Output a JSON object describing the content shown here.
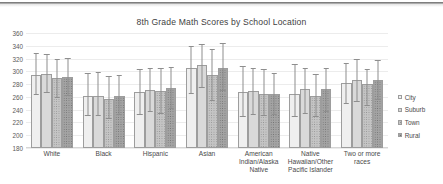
{
  "chart_data": {
    "type": "bar",
    "title": "8th Grade Math Scores by School Location",
    "xlabel": "",
    "ylabel": "",
    "ylim": [
      180,
      360
    ],
    "ytick_step": 20,
    "yticks": [
      360,
      340,
      320,
      300,
      280,
      260,
      240,
      220,
      200,
      180
    ],
    "grid": true,
    "legend_position": "right",
    "error_bars": true,
    "categories": [
      "White",
      "Black",
      "Hispanic",
      "Asian",
      "American Indian/Alaska Native",
      "Native Hawaiian/Other Pacific Islander",
      "Two or more races"
    ],
    "series": [
      {
        "name": "City",
        "color": "#efefef",
        "values": [
          295,
          261,
          267,
          305,
          267,
          265,
          281
        ],
        "err_low": [
          263,
          230,
          232,
          265,
          229,
          229,
          249
        ],
        "err_high": [
          329,
          297,
          303,
          340,
          308,
          311,
          313
        ]
      },
      {
        "name": "Suburb",
        "color": "#d9d9d9",
        "values": [
          296,
          262,
          271,
          310,
          269,
          272,
          287
        ],
        "err_low": [
          266,
          230,
          236,
          274,
          232,
          234,
          252
        ],
        "err_high": [
          327,
          299,
          306,
          343,
          305,
          305,
          320
        ]
      },
      {
        "name": "Town",
        "color": "#c4c4c4",
        "values": [
          289,
          257,
          269,
          294,
          265,
          261,
          280
        ],
        "err_low": [
          258,
          226,
          234,
          254,
          230,
          229,
          246
        ],
        "err_high": [
          320,
          293,
          305,
          335,
          303,
          296,
          303
        ]
      },
      {
        "name": "Rural",
        "color": "#a3a3a3",
        "values": [
          291,
          262,
          274,
          306,
          264,
          273,
          286
        ],
        "err_low": [
          261,
          231,
          241,
          269,
          232,
          237,
          255
        ],
        "err_high": [
          321,
          295,
          307,
          345,
          298,
          305,
          317
        ]
      }
    ]
  }
}
